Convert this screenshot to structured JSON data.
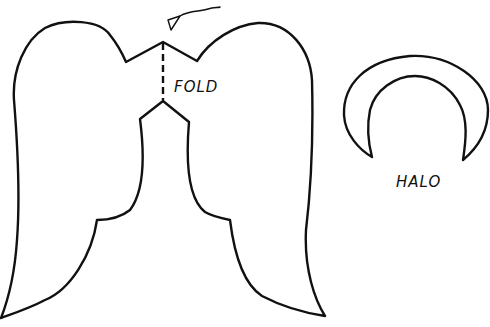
{
  "template": {
    "type": "angel craft cutout template",
    "pieces": [
      {
        "name": "wings",
        "label": "FOLD"
      },
      {
        "name": "halo",
        "label": "HALO"
      }
    ]
  },
  "labels": {
    "fold": "FOLD",
    "halo": "HALO"
  },
  "colors": {
    "line": "#111111",
    "background": "#ffffff"
  }
}
